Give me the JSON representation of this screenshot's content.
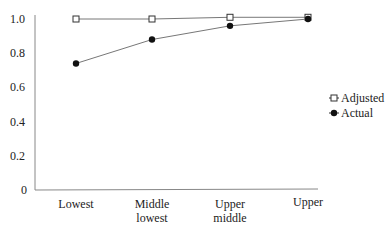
{
  "chart_data": {
    "type": "line",
    "title": "",
    "xlabel": "",
    "ylabel": "",
    "categories": [
      [
        "Lowest"
      ],
      [
        "Middle",
        "lowest"
      ],
      [
        "Upper",
        "middle"
      ],
      [
        "Upper"
      ]
    ],
    "series": [
      {
        "name": "Adjusted",
        "marker": "open-square",
        "values": [
          1.0,
          1.0,
          1.01,
          1.01
        ]
      },
      {
        "name": "Actual",
        "marker": "filled-circle",
        "values": [
          0.74,
          0.88,
          0.96,
          1.0
        ]
      }
    ],
    "ylim": [
      0,
      1.0
    ],
    "yticks": [
      "0",
      "0.2",
      "0.4",
      "0.6",
      "0.8",
      "1.0"
    ],
    "grid": false,
    "legend_position": "right"
  },
  "legend": {
    "items": [
      {
        "label": "Adjusted"
      },
      {
        "label": "Actual"
      }
    ]
  },
  "colors": {
    "line": "#777777",
    "marker": "#111111"
  }
}
